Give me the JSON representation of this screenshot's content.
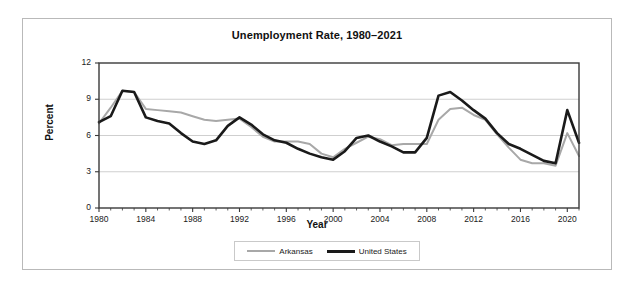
{
  "chart_data": {
    "type": "line",
    "title": "Unemployment Rate, 1980–2021",
    "xlabel": "Year",
    "ylabel": "Percent",
    "ylim": [
      0,
      12
    ],
    "xlim": [
      1980,
      2021
    ],
    "yticks": [
      0,
      3,
      6,
      9,
      12
    ],
    "xticks": [
      1980,
      1984,
      1988,
      1992,
      1996,
      2000,
      2004,
      2008,
      2012,
      2016,
      2020
    ],
    "grid": "horizontal",
    "legend_position": "bottom-center",
    "x": [
      1980,
      1981,
      1982,
      1983,
      1984,
      1985,
      1986,
      1987,
      1988,
      1989,
      1990,
      1991,
      1992,
      1993,
      1994,
      1995,
      1996,
      1997,
      1998,
      1999,
      2000,
      2001,
      2002,
      2003,
      2004,
      2005,
      2006,
      2007,
      2008,
      2009,
      2010,
      2011,
      2012,
      2013,
      2014,
      2015,
      2016,
      2017,
      2018,
      2019,
      2020,
      2021
    ],
    "series": [
      {
        "name": "Arkansas",
        "color": "#a8a8a8",
        "values": [
          7.0,
          8.3,
          9.7,
          9.6,
          8.2,
          8.1,
          8.0,
          7.9,
          7.6,
          7.3,
          7.2,
          7.3,
          7.4,
          6.7,
          5.9,
          5.5,
          5.5,
          5.5,
          5.3,
          4.5,
          4.2,
          4.9,
          5.4,
          5.9,
          5.7,
          5.2,
          5.3,
          5.3,
          5.3,
          7.3,
          8.2,
          8.3,
          7.7,
          7.3,
          6.1,
          5.0,
          4.0,
          3.7,
          3.7,
          3.5,
          6.2,
          4.3
        ]
      },
      {
        "name": "United States",
        "color": "#1a1a1a",
        "values": [
          7.1,
          7.6,
          9.7,
          9.6,
          7.5,
          7.2,
          7.0,
          6.2,
          5.5,
          5.3,
          5.6,
          6.8,
          7.5,
          6.9,
          6.1,
          5.6,
          5.4,
          4.9,
          4.5,
          4.2,
          4.0,
          4.7,
          5.8,
          6.0,
          5.5,
          5.1,
          4.6,
          4.6,
          5.8,
          9.3,
          9.6,
          8.9,
          8.1,
          7.4,
          6.2,
          5.3,
          4.9,
          4.4,
          3.9,
          3.7,
          8.1,
          5.4
        ]
      }
    ]
  },
  "figure": {
    "background": "#ffffff",
    "border_color": "#b9b9b9"
  }
}
